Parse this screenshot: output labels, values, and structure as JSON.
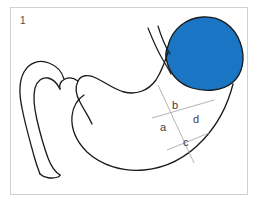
{
  "figure": {
    "number": "1",
    "caption_alt": "Stomach anatomy diagram with shaded fundus and four labeled regions",
    "frame_color": "#d0d0d0",
    "background_color": "#ffffff"
  },
  "anatomy": {
    "shaded_region": {
      "name": "fundus",
      "fill_color": "#1a76c4",
      "stroke_color": "#1a1a1a"
    },
    "outline": {
      "name": "stomach-and-duodenum-outline",
      "stroke_color": "#1a1a1a"
    },
    "esophagus": {
      "name": "esophagus",
      "stroke_color": "#1a1a1a"
    }
  },
  "divider_lines": {
    "stroke_color": "#aaaaaa"
  },
  "labels": {
    "a": "a",
    "b": "b",
    "c": "c",
    "d": "d"
  }
}
